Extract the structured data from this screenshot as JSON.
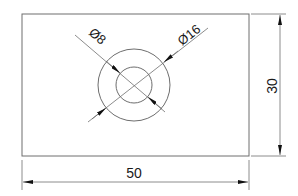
{
  "drawing": {
    "type": "technical-drawing",
    "units": "mm",
    "colors": {
      "line": "#6e6e6e",
      "text": "#1a1a1a",
      "arrow": "#111111",
      "background": "#ffffff"
    },
    "plate": {
      "width": 50,
      "height": 30
    },
    "holes": [
      {
        "label": "Ø8",
        "diameter": 8
      },
      {
        "label": "Ø16",
        "diameter": 16
      }
    ],
    "dimensions": {
      "width_label": "50",
      "height_label": "30",
      "inner_diameter_label": "Ø8",
      "outer_diameter_label": "Ø16"
    }
  }
}
